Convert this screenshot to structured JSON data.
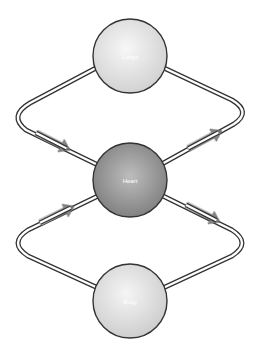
{
  "diagram": {
    "title": "",
    "nodes": [
      {
        "id": "lungs",
        "label": "Lungs",
        "cx": 130,
        "cy": 56,
        "r": 37,
        "fill_light": "#f4f4f4",
        "fill_dark": "#cfcfcf"
      },
      {
        "id": "heart",
        "label": "Heart",
        "cx": 130,
        "cy": 180,
        "r": 37,
        "fill_light": "#c2c2c2",
        "fill_dark": "#7d7d7d"
      },
      {
        "id": "body",
        "label": "Body",
        "cx": 130,
        "cy": 301,
        "r": 37,
        "fill_light": "#f2f2f2",
        "fill_dark": "#cdcdcd"
      }
    ],
    "edges": [
      {
        "id": "lungs-to-heart",
        "from": "lungs",
        "to": "heart",
        "side": "left",
        "direction": "down-right"
      },
      {
        "id": "heart-to-lungs",
        "from": "heart",
        "to": "lungs",
        "side": "right",
        "direction": "up-right"
      },
      {
        "id": "body-to-heart",
        "from": "body",
        "to": "heart",
        "side": "left",
        "direction": "up-right"
      },
      {
        "id": "heart-to-body",
        "from": "heart",
        "to": "body",
        "side": "right",
        "direction": "down-right"
      }
    ],
    "colors": {
      "outline": "#333333",
      "pipe_inner": "#ffffff",
      "arrow_fill": "#8c8c8c",
      "arrow_fill_light": "#d6d6d6",
      "background": "#ffffff"
    }
  }
}
